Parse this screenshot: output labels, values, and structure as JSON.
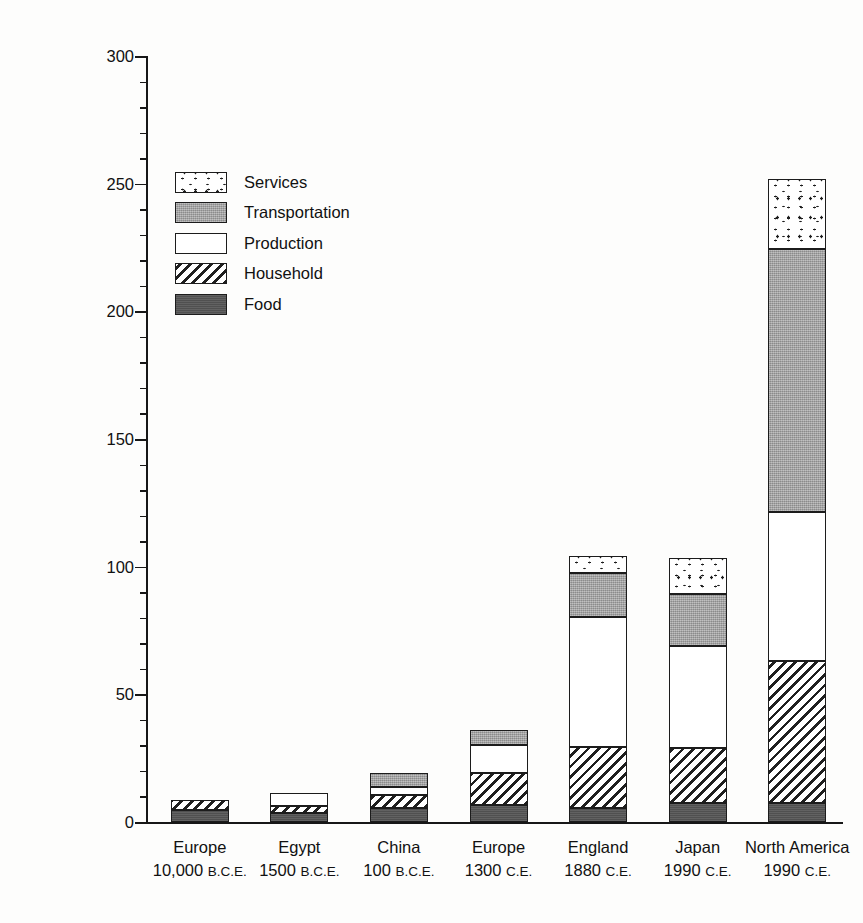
{
  "chart_data": {
    "type": "bar",
    "subtype": "stacked-vertical",
    "title": "",
    "xlabel": "",
    "ylabel": "Per-Capita Energy Consumption (billion joules/year)",
    "ylim": [
      0,
      300
    ],
    "yticks": [
      0,
      50,
      100,
      150,
      200,
      250,
      300
    ],
    "ytick_labels": [
      "0",
      "50",
      "100",
      "150",
      "200",
      "250",
      "300"
    ],
    "yminor_step": 10,
    "grid": false,
    "legend_position": "upper left inside",
    "categories": [
      "Europe 10,000 B.C.E.",
      "Egypt 1500 B.C.E.",
      "China 100 B.C.E.",
      "Europe 1300 C.E.",
      "England 1880 C.E.",
      "Japan 1990 C.E.",
      "North America 1990 C.E."
    ],
    "category_parts": [
      {
        "place": "Europe",
        "year": "10,000",
        "era": "B.C.E."
      },
      {
        "place": "Egypt",
        "year": "1500",
        "era": "B.C.E."
      },
      {
        "place": "China",
        "year": "100",
        "era": "B.C.E."
      },
      {
        "place": "Europe",
        "year": "1300",
        "era": "C.E."
      },
      {
        "place": "England",
        "year": "1880",
        "era": "C.E."
      },
      {
        "place": "Japan",
        "year": "1990",
        "era": "C.E."
      },
      {
        "place": "North America",
        "year": "1990",
        "era": "C.E."
      }
    ],
    "series": [
      {
        "name": "Food",
        "pattern": "solid-dark-gray",
        "color": "#565656",
        "values": [
          4.7,
          3.5,
          5.5,
          6.7,
          5.5,
          7.4,
          7.4
        ]
      },
      {
        "name": "Household",
        "pattern": "diagonal-hatch",
        "color": "#ffffff",
        "values": [
          3.9,
          2.8,
          5.1,
          12.5,
          23.9,
          21.6,
          55.6
        ]
      },
      {
        "name": "Production",
        "pattern": "white",
        "color": "#ffffff",
        "values": [
          0,
          5.1,
          3.1,
          11.0,
          50.9,
          40.0,
          58.5
        ]
      },
      {
        "name": "Transportation",
        "pattern": "solid-light-gray",
        "color": "#a8a8a8",
        "values": [
          0,
          0,
          5.5,
          5.8,
          17.2,
          20.3,
          103.0
        ]
      },
      {
        "name": "Services",
        "pattern": "dotted-speckle",
        "color": "#ffffff",
        "values": [
          0,
          0,
          0,
          0,
          6.5,
          14.1,
          27.4
        ]
      }
    ],
    "totals": [
      8.6,
      11.4,
      19.2,
      36.0,
      104.0,
      103.4,
      251.9
    ]
  },
  "legend": {
    "items": [
      {
        "label": "Services",
        "pattern": "dotted-speckle"
      },
      {
        "label": "Transportation",
        "pattern": "solid-light-gray"
      },
      {
        "label": "Production",
        "pattern": "white"
      },
      {
        "label": "Household",
        "pattern": "diagonal-hatch"
      },
      {
        "label": "Food",
        "pattern": "solid-dark-gray"
      }
    ]
  },
  "axis": {
    "y_title": "Per-Capita Energy Consumption (billion joules/year)",
    "y_labels": [
      "300",
      "250",
      "200",
      "150",
      "100",
      "50",
      "0"
    ]
  }
}
